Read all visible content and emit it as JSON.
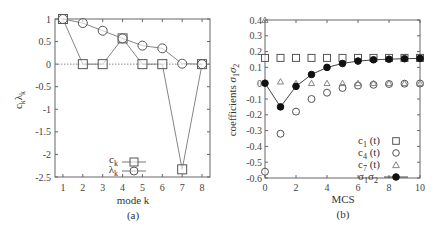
{
  "chart_data": [
    {
      "type": "line",
      "panel_label": "(a)",
      "xlabel": "mode k",
      "ylabel": "c_k, λ_k",
      "xlim": [
        0.6,
        8.4
      ],
      "ylim": [
        -2.5,
        1
      ],
      "x_ticks": [
        1,
        2,
        3,
        4,
        5,
        6,
        7,
        8
      ],
      "y_ticks": [
        1,
        0.5,
        0,
        -0.5,
        -1,
        -1.5,
        -2,
        -2.5
      ],
      "y_tick_labels": [
        "1",
        "0.5",
        "0",
        "-0.5",
        "-1",
        "-1.5",
        "-2",
        "-2.5"
      ],
      "zero_line": true,
      "x": [
        1,
        2,
        3,
        4,
        5,
        6,
        7,
        8
      ],
      "series": [
        {
          "name": "c_k",
          "marker": "square",
          "values": [
            1.0,
            0.0,
            0.0,
            0.57,
            0.0,
            0.0,
            -2.33,
            0.0
          ]
        },
        {
          "name": "λ_k",
          "marker": "circle",
          "values": [
            1.0,
            0.91,
            0.74,
            0.57,
            0.41,
            0.35,
            0.01,
            0.0
          ]
        }
      ],
      "legend": {
        "position": "lower center",
        "entries": [
          "c_k",
          "λ_k"
        ]
      }
    },
    {
      "type": "scatter",
      "panel_label": "(b)",
      "xlabel": "MCS",
      "ylabel": "coefficients σ1σ2",
      "xlim": [
        0,
        10
      ],
      "ylim": [
        -0.6,
        0.4
      ],
      "x_ticks": [
        0,
        2,
        4,
        6,
        8,
        10
      ],
      "y_ticks": [
        0.4,
        0.3,
        0.2,
        0.1,
        0,
        -0.1,
        -0.2,
        -0.3,
        -0.4,
        -0.5,
        -0.6
      ],
      "y_tick_labels": [
        "0.4",
        "0.3",
        "0.2",
        "0.1",
        "0",
        "-0.1",
        "-0.2",
        "-0.3",
        "-0.4",
        "-0.5",
        "-0.6"
      ],
      "x": [
        0,
        1,
        2,
        3,
        4,
        5,
        6,
        7,
        8,
        9,
        10
      ],
      "series": [
        {
          "name": "c_1 (t)",
          "marker": "square",
          "line": false,
          "values": [
            0.16,
            0.16,
            0.16,
            0.16,
            0.16,
            0.16,
            0.16,
            0.16,
            0.16,
            0.16,
            0.16
          ]
        },
        {
          "name": "c_4 (t)",
          "marker": "circle",
          "line": false,
          "values": [
            -0.56,
            -0.32,
            -0.18,
            -0.1,
            -0.06,
            -0.03,
            -0.015,
            -0.01,
            -0.005,
            -0.003,
            -0.002
          ]
        },
        {
          "name": "c_7 (t)",
          "marker": "triangle",
          "line": false,
          "values": [
            0.4,
            0.01,
            0.0,
            0.0,
            0.0,
            0.0,
            0.0,
            0.0,
            0.0,
            0.0,
            0.0
          ]
        },
        {
          "name": "σ1σ2",
          "marker": "filled-circle",
          "line": true,
          "values": [
            0.0,
            -0.15,
            -0.02,
            0.055,
            0.1,
            0.125,
            0.14,
            0.148,
            0.152,
            0.155,
            0.157
          ]
        }
      ],
      "legend": {
        "position": "lower right",
        "entries": [
          "c_1 (t)",
          "c_4 (t)",
          "c_7 (t)",
          "σ1σ2"
        ]
      }
    }
  ],
  "panels": {
    "a": {
      "caption": "(a)",
      "xlabel": "mode k",
      "ylabel_main": "c",
      "ylabel_sub1": "k",
      "ylabel_main2": "λ",
      "ylabel_sub2": "k",
      "legend": [
        {
          "main": "c",
          "sub": "k"
        },
        {
          "main": "λ",
          "sub": "k"
        }
      ]
    },
    "b": {
      "caption": "(b)",
      "xlabel": "MCS",
      "ylabel": "coefficients",
      "ylabel_sigma": "σ",
      "ylabel_s1": "1",
      "ylabel_sigma2": "σ",
      "ylabel_s2": "2",
      "legend": [
        {
          "main": "c",
          "sub": "1",
          "tail": " (t)"
        },
        {
          "main": "c",
          "sub": "4",
          "tail": " (t)"
        },
        {
          "main": "c",
          "sub": "7",
          "tail": " (t)"
        },
        {
          "main": "σ",
          "sub": "1",
          "main2": "σ",
          "sub2": "2"
        }
      ]
    }
  }
}
